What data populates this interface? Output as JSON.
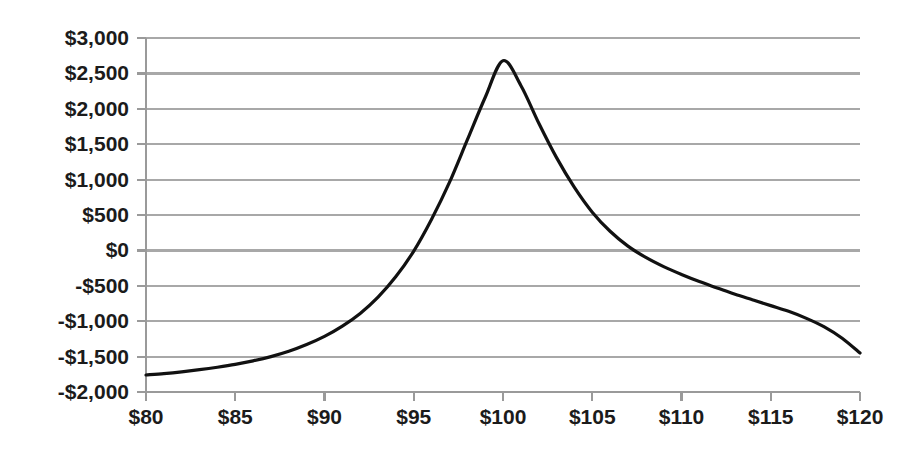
{
  "chart_data": {
    "type": "line",
    "title": "",
    "subtitle": "",
    "xlabel": "",
    "ylabel": "",
    "xlim": [
      80,
      120
    ],
    "ylim": [
      -2000,
      3000
    ],
    "grid": true,
    "legend": null,
    "legend_position": "none",
    "x_tick_labels": [
      "$80",
      "$85",
      "$90",
      "$95",
      "$100",
      "$105",
      "$110",
      "$115",
      "$120"
    ],
    "x_ticks": [
      80,
      85,
      90,
      95,
      100,
      105,
      110,
      115,
      120
    ],
    "y_tick_labels": [
      "$3,000",
      "$2,500",
      "$2,000",
      "$1,500",
      "$1,000",
      "$500",
      "$0",
      "-$500",
      "-$1,000",
      "-$1,500",
      "-$2,000"
    ],
    "y_ticks": [
      3000,
      2500,
      2000,
      1500,
      1000,
      500,
      0,
      -500,
      -1000,
      -1500,
      -2000
    ],
    "series": [
      {
        "name": "Profit",
        "color": "#111111",
        "x": [
          80,
          81,
          82,
          83,
          84,
          85,
          86,
          87,
          88,
          89,
          90,
          91,
          92,
          93,
          94,
          95,
          96,
          97,
          98,
          99,
          100,
          101,
          102,
          103,
          104,
          105,
          106,
          107,
          108,
          109,
          110,
          111,
          112,
          113,
          114,
          115,
          116,
          117,
          118,
          119,
          120
        ],
        "values": [
          -1760,
          -1740,
          -1715,
          -1685,
          -1650,
          -1610,
          -1560,
          -1500,
          -1425,
          -1330,
          -1215,
          -1070,
          -890,
          -660,
          -370,
          -10,
          440,
          960,
          1560,
          2160,
          2680,
          2330,
          1800,
          1310,
          890,
          540,
          270,
          60,
          -100,
          -230,
          -340,
          -440,
          -530,
          -620,
          -700,
          -780,
          -860,
          -960,
          -1080,
          -1240,
          -1450
        ]
      }
    ],
    "annotations": []
  },
  "figure": {
    "background_color": "#fefefe",
    "plot_background_color": "#ffffff",
    "gridline_color": "#a8a8a8",
    "axis_color": "#9a9a9a",
    "text_color": "#1b1b1b",
    "curve_color": "#111111"
  }
}
